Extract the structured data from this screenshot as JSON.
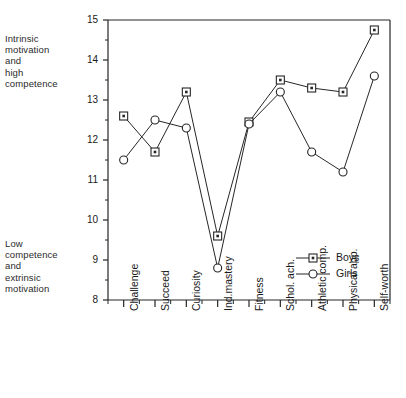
{
  "annotations": {
    "high": "Intrinsic\nmotivation\nand\nhigh\ncompetence",
    "low": "Low\ncompetence\nand\nextrinsic\nmotivation"
  },
  "legend": {
    "boys": "Boys",
    "girls": "Girls"
  },
  "chart_data": {
    "type": "line",
    "title": "",
    "xlabel": "",
    "ylabel": "",
    "ylim": [
      8,
      15
    ],
    "yticks": [
      8,
      9,
      10,
      11,
      12,
      13,
      14,
      15
    ],
    "ytick_labels": [
      "8",
      "9",
      "10",
      "11",
      "12",
      "13",
      "14",
      "15"
    ],
    "minor_ticks": true,
    "grid": false,
    "legend_position": "lower-right",
    "categories": [
      "Challenge",
      "Succeed",
      "Curiosity",
      "Ind.mastery",
      "Fitness",
      "Schol. ach.",
      "Athletic comp.",
      "Physical app.",
      "Self-worth"
    ],
    "series": [
      {
        "name": "Boys",
        "marker": "square",
        "values": [
          12.6,
          11.7,
          13.2,
          9.6,
          12.45,
          13.5,
          13.3,
          13.2,
          14.75
        ]
      },
      {
        "name": "Girls",
        "marker": "circle",
        "values": [
          11.5,
          12.5,
          12.3,
          8.8,
          12.4,
          13.2,
          11.7,
          11.2,
          13.6
        ]
      }
    ]
  },
  "colors": {
    "line": "#262626",
    "axis": "#262626",
    "marker_fill": "#ffffff",
    "background": "#ffffff"
  }
}
